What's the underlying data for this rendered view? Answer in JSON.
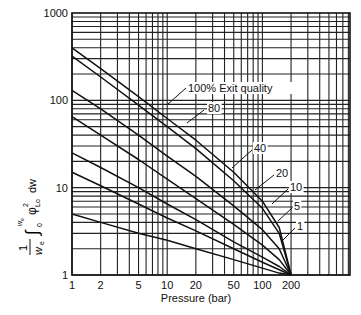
{
  "chart_data": {
    "type": "line",
    "title": "",
    "xlabel": "Pressure (bar)",
    "ylabel": "(1/w_e) ∫0^we φ²Lo dw",
    "xscale": "log",
    "yscale": "log",
    "xlim": [
      1,
      800
    ],
    "ylim": [
      1,
      1000
    ],
    "grid": true,
    "x_ticks": [
      "1",
      "2",
      "5",
      "10",
      "20",
      "50",
      "100",
      "200"
    ],
    "y_ticks": [
      "1",
      "10",
      "100",
      "1000"
    ],
    "x": [
      1,
      2,
      5,
      10,
      20,
      50,
      100,
      150,
      200
    ],
    "series": [
      {
        "name": "100% Exit quality",
        "values": [
          400,
          230,
          110,
          62,
          35,
          15,
          7,
          3.5,
          1
        ]
      },
      {
        "name": "80",
        "values": [
          320,
          185,
          88,
          50,
          28,
          12,
          5.8,
          3,
          1
        ]
      },
      {
        "name": "40",
        "values": [
          130,
          80,
          40,
          23,
          13.5,
          6.2,
          3.3,
          2,
          1
        ]
      },
      {
        "name": "20",
        "values": [
          65,
          40,
          21,
          12.5,
          7.5,
          3.8,
          2.2,
          1.5,
          1
        ]
      },
      {
        "name": "10",
        "values": [
          25,
          17,
          10,
          6.5,
          4.3,
          2.4,
          1.6,
          1.25,
          1
        ]
      },
      {
        "name": "5",
        "values": [
          15,
          10.5,
          6.5,
          4.5,
          3.2,
          2,
          1.4,
          1.15,
          1
        ]
      },
      {
        "name": "1",
        "values": [
          5,
          4,
          3,
          2.5,
          2,
          1.5,
          1.2,
          1.05,
          1
        ]
      }
    ],
    "annotations": [
      "100% Exit quality",
      "80",
      "40",
      "20",
      "10",
      "5",
      "1"
    ]
  },
  "axes": {
    "x_title": "Pressure (bar)",
    "y_title_main": "φ",
    "y_title_frac_num": "1",
    "y_title_frac_den": "w",
    "y_title_den_sub": "e",
    "y_title_upper": "w",
    "y_title_upper_sub": "e",
    "y_title_lower": "0",
    "y_title_sup": "2",
    "y_title_sub": "Lo",
    "y_title_dw": "dw"
  }
}
